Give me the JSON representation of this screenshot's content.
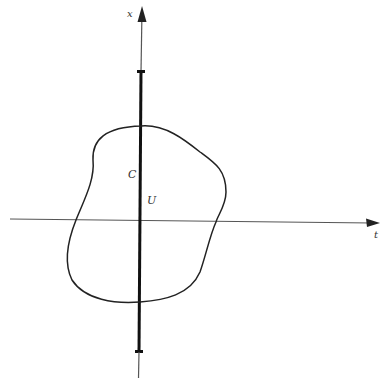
{
  "diagram": {
    "axes": {
      "horizontal_label": "t",
      "vertical_label": "x"
    },
    "labels": {
      "curve": "C",
      "region": "U"
    },
    "colors": {
      "stroke": "#222222",
      "axis": "#555555",
      "background": "#ffffff"
    }
  }
}
